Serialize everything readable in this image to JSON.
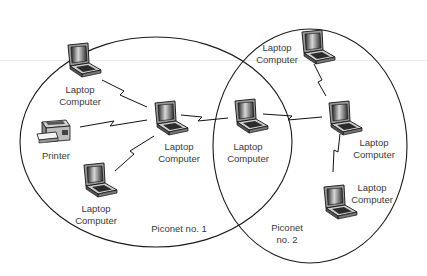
{
  "diagram": {
    "colors": {
      "stroke": "#1a1a1a",
      "text": "#3a3a3a",
      "background": "#ffffff"
    },
    "piconets": [
      {
        "id": "p1",
        "label": "Piconet no. 1",
        "label_lines": [
          "Piconet no. 1"
        ],
        "cx": 156,
        "cy": 142,
        "rx": 136,
        "ry": 105
      },
      {
        "id": "p2",
        "label": "Piconet no. 2",
        "label_lines": [
          "Piconet",
          "no. 2"
        ],
        "cx": 310,
        "cy": 145,
        "rx": 97,
        "ry": 117
      }
    ],
    "nodes": [
      {
        "id": "n1",
        "type": "laptop",
        "label_lines": [
          "Laptop",
          "Computer"
        ],
        "x": 66,
        "y": 43
      },
      {
        "id": "n2",
        "type": "printer",
        "label_lines": [
          "Printer"
        ],
        "x": 36,
        "y": 120
      },
      {
        "id": "n3",
        "type": "laptop",
        "label_lines": [
          "Laptop",
          "Computer"
        ],
        "x": 82,
        "y": 163
      },
      {
        "id": "n4",
        "type": "laptop",
        "label_lines": [
          "Laptop",
          "Computer"
        ],
        "x": 152,
        "y": 101
      },
      {
        "id": "n5",
        "type": "laptop",
        "label_lines": [
          "Laptop",
          "Computer"
        ],
        "x": 233,
        "y": 99
      },
      {
        "id": "n6",
        "type": "laptop",
        "label_lines": [
          "Laptop",
          "Computer"
        ],
        "x": 300,
        "y": 30
      },
      {
        "id": "n7",
        "type": "laptop",
        "label_lines": [
          "Laptop",
          "Computer"
        ],
        "x": 327,
        "y": 101
      },
      {
        "id": "n8",
        "type": "laptop",
        "label_lines": [
          "Laptop",
          "Computer"
        ],
        "x": 322,
        "y": 185
      }
    ],
    "links": [
      {
        "from": "n1",
        "to": "n4"
      },
      {
        "from": "n2",
        "to": "n4"
      },
      {
        "from": "n3",
        "to": "n4"
      },
      {
        "from": "n4",
        "to": "n5"
      },
      {
        "from": "n5",
        "to": "n7"
      },
      {
        "from": "n6",
        "to": "n7"
      },
      {
        "from": "n7",
        "to": "n8"
      }
    ],
    "labels": {
      "n1": {
        "line1": "Laptop",
        "line2": "Computer"
      },
      "n2": {
        "line1": "Printer"
      },
      "n3": {
        "line1": "Laptop",
        "line2": "Computer"
      },
      "n4": {
        "line1": "Laptop",
        "line2": "Computer"
      },
      "n5": {
        "line1": "Laptop",
        "line2": "Computer"
      },
      "n6": {
        "line1": "Laptop",
        "line2": "Computer"
      },
      "n7": {
        "line1": "Laptop",
        "line2": "Computer"
      },
      "n8": {
        "line1": "Laptop",
        "line2": "Computer"
      },
      "p1": {
        "line1": "Piconet no. 1"
      },
      "p2": {
        "line1": "Piconet",
        "line2": "no. 2"
      }
    }
  }
}
